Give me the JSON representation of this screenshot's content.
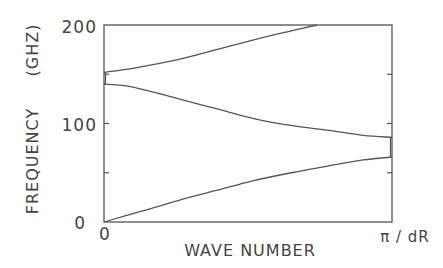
{
  "chart_data": {
    "type": "line",
    "title": "",
    "xlabel": "WAVE NUMBER",
    "ylabel": "FREQUENCY (GHZ)",
    "ylabel_parts": [
      "FREQUENCY",
      "(GHZ)"
    ],
    "x_tick_labels": [
      "0",
      "π / dR"
    ],
    "xlim": [
      0,
      1
    ],
    "ylim": [
      0,
      200
    ],
    "y_ticks": [
      0,
      50,
      100,
      150,
      200
    ],
    "y_tick_labels": [
      "0",
      "",
      "100",
      "",
      "200"
    ],
    "grid": false,
    "legend": null,
    "series": [
      {
        "name": "lower branch",
        "x": [
          0,
          0.13,
          0.26,
          0.39,
          0.52,
          0.65,
          0.78,
          0.9,
          1.0
        ],
        "y": [
          0,
          11,
          22,
          32,
          42,
          50,
          57,
          63,
          66
        ]
      },
      {
        "name": "middle branch",
        "x": [
          0,
          0.1,
          0.26,
          0.39,
          0.52,
          0.65,
          0.78,
          0.9,
          1.0
        ],
        "y": [
          140,
          137,
          125,
          115,
          105,
          98,
          93,
          88,
          86
        ]
      },
      {
        "name": "upper branch",
        "x": [
          0,
          0.1,
          0.26,
          0.39,
          0.52,
          0.65,
          0.74
        ],
        "y": [
          152,
          156,
          165,
          175,
          185,
          194,
          200
        ]
      }
    ]
  }
}
